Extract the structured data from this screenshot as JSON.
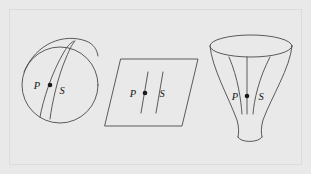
{
  "figure": {
    "background_color": "#e9e9e9",
    "frame_border_color": "#dcdcdc",
    "stroke_color": "#4a4a4a",
    "label_color": "#151515",
    "point_color": "#1a1a1a",
    "panels": [
      {
        "id": "sphere",
        "name": "sphere-panel",
        "shape": "circle",
        "description": "circle representing a sphere with two converging geodesic curves",
        "geodesic_behavior": "converging",
        "circle": {
          "cx": 60,
          "cy": 85,
          "r": 38
        },
        "labels": [
          {
            "text": "P",
            "x": 37,
            "y": 89
          },
          {
            "text": "S",
            "x": 62,
            "y": 94
          }
        ],
        "points": [
          {
            "x": 50,
            "y": 85,
            "r": 2.3
          }
        ]
      },
      {
        "id": "plane",
        "name": "plane-panel",
        "shape": "parallelogram",
        "description": "parallelogram representing a flat plane with two parallel geodesic lines",
        "geodesic_behavior": "parallel",
        "labels": [
          {
            "text": "P",
            "x": 131,
            "y": 97
          },
          {
            "text": "S",
            "x": 160,
            "y": 97
          }
        ],
        "points": [
          {
            "x": 145,
            "y": 93,
            "r": 2.3
          }
        ]
      },
      {
        "id": "funnel",
        "name": "funnel-panel",
        "shape": "trumpet",
        "description": "trumpet or funnel shaped surface with diverging geodesic curves",
        "geodesic_behavior": "diverging",
        "labels": [
          {
            "text": "P",
            "x": 233,
            "y": 100
          },
          {
            "text": "S",
            "x": 259,
            "y": 100
          }
        ],
        "points": [
          {
            "x": 247,
            "y": 96,
            "r": 2.3
          }
        ]
      }
    ],
    "labels_all": [
      "P",
      "S",
      "P",
      "S",
      "P",
      "S"
    ]
  }
}
